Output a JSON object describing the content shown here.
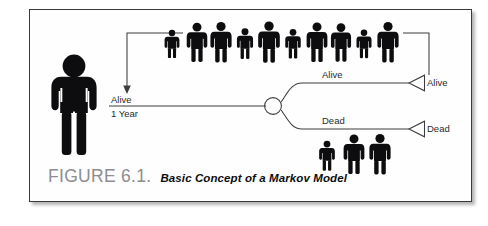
{
  "figure": {
    "caption_label": "FIGURE 6.1.",
    "caption_text": "Basic Concept of a Markov Model",
    "caption_label_color": "#8d8d91",
    "caption_text_color": "#0d0d0f",
    "border_color": "#3a3a3c",
    "background_color": "#ffffff",
    "line_color": "#3c3c40",
    "figure_fill_color": "#0d0d0f"
  },
  "diagram": {
    "type": "markov-model-state-diagram",
    "cycle_label_top": "Alive",
    "cycle_label_bottom": "1 Year",
    "branch_label_alive": "Alive",
    "branch_label_dead": "Dead",
    "terminal_label_alive": "Alive",
    "terminal_label_dead": "Dead",
    "cohort_top_count": 10,
    "cohort_bottom_count": 3,
    "start_person_label": "cohort-person"
  }
}
